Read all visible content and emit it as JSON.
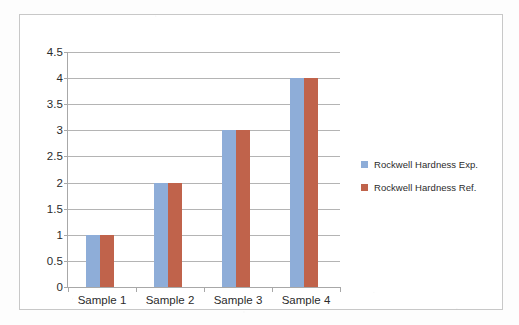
{
  "chart_data": {
    "type": "bar",
    "title": "",
    "xlabel": "",
    "ylabel": "",
    "categories": [
      "Sample 1",
      "Sample 2",
      "Sample 3",
      "Sample 4"
    ],
    "series": [
      {
        "name": "Rockwell Hardness Exp.",
        "color": "#8EADD8",
        "values": [
          1,
          2,
          3,
          4
        ]
      },
      {
        "name": "Rockwell Hardness Ref.",
        "color": "#C0634B",
        "values": [
          1,
          2,
          3,
          4
        ]
      }
    ],
    "ylim": [
      0,
      4.5
    ],
    "y_ticks": [
      "0",
      "0.5",
      "1",
      "1.5",
      "2",
      "2.5",
      "3",
      "3.5",
      "4",
      "4.5"
    ],
    "y_tick_values": [
      0,
      0.5,
      1,
      1.5,
      2,
      2.5,
      3,
      3.5,
      4,
      4.5
    ],
    "grid": true,
    "grid_axis": "y",
    "grid_color": "#b4b4b4",
    "legend_position": "right",
    "axis_color": "#a8a8a8",
    "plot_background": "#ffffff",
    "frame_border_color": "#c8c8c8",
    "text_color": "#2b2b2b"
  },
  "legend": {
    "items": [
      {
        "label": "Rockwell Hardness Exp.",
        "color": "#8EADD8"
      },
      {
        "label": "Rockwell Hardness Ref.",
        "color": "#C0634B"
      }
    ]
  }
}
